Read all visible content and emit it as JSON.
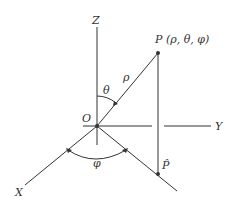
{
  "diagram": {
    "labels": {
      "z_axis": "Z",
      "y_axis": "Y",
      "x_axis": "X",
      "origin": "O",
      "point": "P (ρ, θ, φ)",
      "rho": "ρ",
      "theta": "θ",
      "phi": "φ",
      "projection": "P̂"
    },
    "colors": {
      "line": "#333333",
      "background": "#ffffff"
    }
  }
}
